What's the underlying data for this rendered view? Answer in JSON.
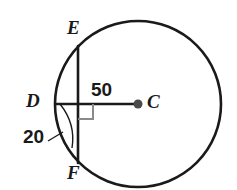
{
  "figure": {
    "kind": "circle-geometry-diagram",
    "background_color": "#ffffff",
    "stroke_color": "#1a1a1a",
    "accent_color": "#8a8a8a",
    "circle": {
      "name": "circle-C",
      "center_x": 138,
      "center_y": 104,
      "radius": 83
    },
    "center_point": {
      "label": "C",
      "x": 138,
      "y": 104,
      "dot_radius": 4.5
    },
    "chord": {
      "name": "chord-EF",
      "x": 78,
      "y_top": 46,
      "y_bottom": 163
    },
    "radius_segment": {
      "name": "segment-DC",
      "x_start": 56,
      "x_end": 138,
      "y": 104
    },
    "intersection_point": {
      "label": "D",
      "x": 78,
      "y": 104
    },
    "right_angle_marker": {
      "x": 78,
      "y": 104,
      "size": 15
    },
    "arc_marker": {
      "name": "arc-DF-marker",
      "start_x": 60,
      "start_y": 104,
      "end_x": 72,
      "end_y": 143
    },
    "leader_line": {
      "x1": 50,
      "y1": 140,
      "x2": 62,
      "y2": 131
    },
    "labels": {
      "E": "E",
      "D": "D",
      "C": "C",
      "F": "F",
      "measure_radius": "50",
      "measure_arc": "20"
    }
  }
}
